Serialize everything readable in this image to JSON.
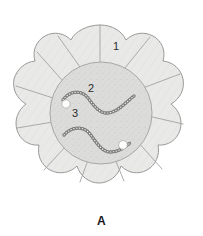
{
  "figure": {
    "panel_letter": "A",
    "background_color": "#ffffff",
    "outline_color": "#9a9a9a",
    "outer_cell_fill": "#e9e9e7",
    "outer_cell_stroke": "#a3a3a0",
    "central_region_fill": "#dcdcda",
    "central_region_stroke": "#a8a8a5",
    "chain_color": "#8e8e8b",
    "dot_fill": "#ffffff",
    "dot_stroke": "#b0b0ad",
    "label_color": "#2b2b2b"
  },
  "labels": [
    {
      "id": "1",
      "text": "1",
      "refers_to": "outer-cell"
    },
    {
      "id": "2",
      "text": "2",
      "refers_to": "beaded-chain"
    },
    {
      "id": "3",
      "text": "3",
      "refers_to": "white-dot"
    }
  ],
  "geometry": {
    "center": {
      "x": 100,
      "y": 113
    },
    "outer_radius": 88,
    "lobe_count": 12,
    "central_circle": {
      "cx": 101,
      "cy": 113,
      "r": 51
    },
    "white_dots": [
      {
        "cx": 66,
        "cy": 104,
        "r": 4.2
      },
      {
        "cx": 123,
        "cy": 145,
        "r": 4.4
      }
    ],
    "chains": [
      {
        "name": "upper-beaded-chain",
        "path": "M 63,100 C 70,90 82,90 88,98 C 94,106 100,114 108,113 C 118,112 126,102 134,96",
        "beads": 34
      },
      {
        "name": "lower-beaded-chain",
        "path": "M 64,135 C 72,126 84,126 90,134 C 96,142 102,152 110,152 C 118,152 124,148 130,143",
        "beads": 34
      }
    ]
  }
}
